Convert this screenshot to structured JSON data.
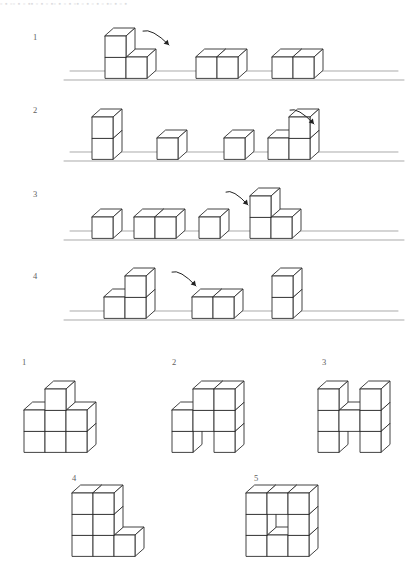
{
  "page": {
    "header_fragment": "▫ ▪ ▫▫ ▪ ▫ ▪▪ ▫ ▪ ▫ ▪▫ ▪ ▫ ▪ ▫▪ ▫ ▪ ▫ ▪ ▫ ▪▫ ▪ ▫ ▪",
    "background_color": "#ffffff",
    "line_color": "#2e2e2e",
    "ground_color": "#9b9b9b",
    "arrow_color": "#222222",
    "label_color": "#5e5e5e"
  },
  "questions": {
    "rows": [
      {
        "label": "1",
        "label_x": 33,
        "label_y": 33,
        "ground_y": 80,
        "ground_segments": [
          [
            64,
            404
          ]
        ],
        "arrow": {
          "x": 143,
          "y": 31,
          "dx": 26,
          "dy": 14,
          "curve": -10
        },
        "groups": [
          {
            "name": "L-shape-3-cubes",
            "cubes": [
              [
                0,
                0,
                0
              ],
              [
                1,
                0,
                0
              ],
              [
                0,
                1,
                0
              ]
            ],
            "origin_x": 105,
            "origin_y": 78
          },
          {
            "name": "pair-horizontal",
            "cubes": [
              [
                0,
                0,
                0
              ],
              [
                1,
                0,
                0
              ]
            ],
            "origin_x": 196,
            "origin_y": 78
          },
          {
            "name": "pair-horizontal",
            "cubes": [
              [
                0,
                0,
                0
              ],
              [
                1,
                0,
                0
              ]
            ],
            "origin_x": 272,
            "origin_y": 78
          }
        ]
      },
      {
        "label": "2",
        "label_x": 33,
        "label_y": 106,
        "ground_y": 161,
        "ground_segments": [
          [
            64,
            404
          ]
        ],
        "arrow": {
          "x": 290,
          "y": 110,
          "dx": 24,
          "dy": 14,
          "curve": -10
        },
        "groups": [
          {
            "name": "stack-vertical-2",
            "cubes": [
              [
                0,
                0,
                0
              ],
              [
                0,
                1,
                0
              ]
            ],
            "origin_x": 92,
            "origin_y": 159
          },
          {
            "name": "single-cube",
            "cubes": [
              [
                0,
                0,
                0
              ]
            ],
            "origin_x": 157,
            "origin_y": 159
          },
          {
            "name": "single-cube",
            "cubes": [
              [
                0,
                0,
                0
              ]
            ],
            "origin_x": 224,
            "origin_y": 159
          },
          {
            "name": "L-shape-3-cubes-right",
            "cubes": [
              [
                0,
                0,
                0
              ],
              [
                1,
                0,
                0
              ],
              [
                1,
                1,
                0
              ]
            ],
            "origin_x": 268,
            "origin_y": 159
          }
        ]
      },
      {
        "label": "3",
        "label_x": 33,
        "label_y": 190,
        "ground_y": 240,
        "ground_segments": [
          [
            64,
            404
          ]
        ],
        "arrow": {
          "x": 226,
          "y": 192,
          "dx": 22,
          "dy": 13,
          "curve": -10
        },
        "groups": [
          {
            "name": "single-cube",
            "cubes": [
              [
                0,
                0,
                0
              ]
            ],
            "origin_x": 92,
            "origin_y": 238
          },
          {
            "name": "pair-horizontal",
            "cubes": [
              [
                0,
                0,
                0
              ],
              [
                1,
                0,
                0
              ]
            ],
            "origin_x": 134,
            "origin_y": 238
          },
          {
            "name": "single-cube",
            "cubes": [
              [
                0,
                0,
                0
              ]
            ],
            "origin_x": 199,
            "origin_y": 238
          },
          {
            "name": "L-shape-3-cubes",
            "cubes": [
              [
                0,
                0,
                0
              ],
              [
                1,
                0,
                0
              ],
              [
                0,
                1,
                0
              ]
            ],
            "origin_x": 250,
            "origin_y": 238
          }
        ]
      },
      {
        "label": "4",
        "label_x": 33,
        "label_y": 272,
        "ground_y": 320,
        "ground_segments": [
          [
            64,
            404
          ]
        ],
        "arrow": {
          "x": 172,
          "y": 272,
          "dx": 24,
          "dy": 14,
          "curve": -10
        },
        "groups": [
          {
            "name": "T-shape-3-cubes",
            "cubes": [
              [
                0,
                0,
                0
              ],
              [
                1,
                0,
                0
              ],
              [
                1,
                1,
                0
              ]
            ],
            "origin_x": 104,
            "origin_y": 318,
            "variant": "middle-top"
          },
          {
            "name": "pair-horizontal",
            "cubes": [
              [
                0,
                0,
                0
              ],
              [
                1,
                0,
                0
              ]
            ],
            "origin_x": 192,
            "origin_y": 318
          },
          {
            "name": "stack-vertical-2",
            "cubes": [
              [
                0,
                0,
                0
              ],
              [
                0,
                1,
                0
              ]
            ],
            "origin_x": 272,
            "origin_y": 318
          }
        ]
      }
    ]
  },
  "options": {
    "items": [
      {
        "label": "1",
        "label_x": 22,
        "label_y": 358,
        "origin_x": 24,
        "origin_y": 452,
        "name": "option-block-3x2-plus-top",
        "cubes": [
          [
            0,
            0,
            0
          ],
          [
            1,
            0,
            0
          ],
          [
            2,
            0,
            0
          ],
          [
            0,
            1,
            0
          ],
          [
            1,
            1,
            0
          ],
          [
            2,
            1,
            0
          ],
          [
            1,
            2,
            0
          ]
        ]
      },
      {
        "label": "2",
        "label_x": 172,
        "label_y": 358,
        "origin_x": 172,
        "origin_y": 452,
        "name": "option-stepped-with-gap",
        "cubes": [
          [
            0,
            0,
            0
          ],
          [
            2,
            0,
            0
          ],
          [
            0,
            1,
            0
          ],
          [
            1,
            1,
            0
          ],
          [
            2,
            1,
            0
          ],
          [
            1,
            2,
            0
          ],
          [
            2,
            2,
            0
          ]
        ]
      },
      {
        "label": "3",
        "label_x": 322,
        "label_y": 358,
        "origin_x": 318,
        "origin_y": 452,
        "name": "option-h-shape",
        "cubes": [
          [
            0,
            0,
            0
          ],
          [
            2,
            0,
            0
          ],
          [
            0,
            1,
            0
          ],
          [
            1,
            1,
            0
          ],
          [
            2,
            1,
            0
          ],
          [
            0,
            2,
            0
          ],
          [
            2,
            2,
            0
          ]
        ]
      },
      {
        "label": "4",
        "label_x": 72,
        "label_y": 474,
        "origin_x": 72,
        "origin_y": 556,
        "name": "option-l-shape-tall",
        "cubes": [
          [
            0,
            0,
            0
          ],
          [
            1,
            0,
            0
          ],
          [
            2,
            0,
            0
          ],
          [
            0,
            1,
            0
          ],
          [
            1,
            1,
            0
          ],
          [
            0,
            2,
            0
          ],
          [
            1,
            2,
            0
          ]
        ]
      },
      {
        "label": "5",
        "label_x": 254,
        "label_y": 474,
        "origin_x": 246,
        "origin_y": 556,
        "name": "option-3x3-with-notch",
        "cubes": [
          [
            0,
            0,
            0
          ],
          [
            1,
            0,
            0
          ],
          [
            2,
            0,
            0
          ],
          [
            0,
            1,
            0
          ],
          [
            2,
            1,
            0
          ],
          [
            0,
            2,
            0
          ],
          [
            1,
            2,
            0
          ],
          [
            2,
            2,
            0
          ]
        ]
      }
    ]
  }
}
